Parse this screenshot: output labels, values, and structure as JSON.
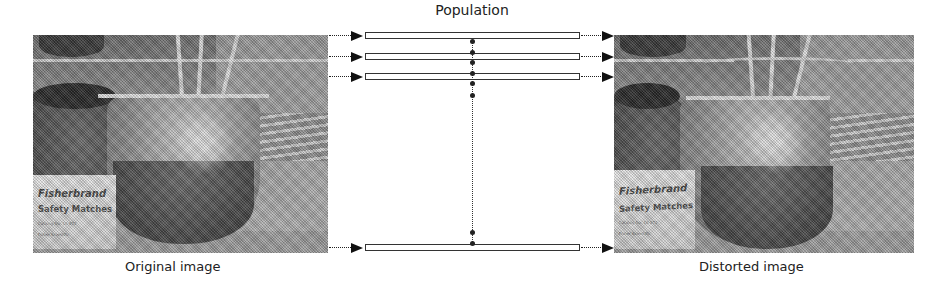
{
  "diagram": {
    "title": "Population",
    "rows": [
      {
        "id": 1,
        "y": 36
      },
      {
        "id": 2,
        "y": 57
      },
      {
        "id": 3,
        "y": 77
      },
      {
        "id": 4,
        "y": 248
      }
    ],
    "connector": {
      "type": "dotted-vertical",
      "from_row": 1,
      "to_row": 4
    }
  },
  "images": {
    "original": {
      "caption": "Original image",
      "box_text_line1": "Fisherbrand",
      "box_text_line2": "Safety Matches",
      "box_text_line3": "Catalog No. 10-872",
      "box_text_line4": "Fisher Scientific"
    },
    "distorted": {
      "caption": "Distorted image",
      "box_text_line1": "Fisherbrand",
      "box_text_line2": "Safety Matches",
      "box_text_line3": "Catalog No. 10-872",
      "box_text_line4": "Fisher Scientific"
    }
  },
  "colors": {
    "arrow": "#111111",
    "bar_border": "#333333",
    "text": "#222222",
    "background": "#ffffff"
  }
}
